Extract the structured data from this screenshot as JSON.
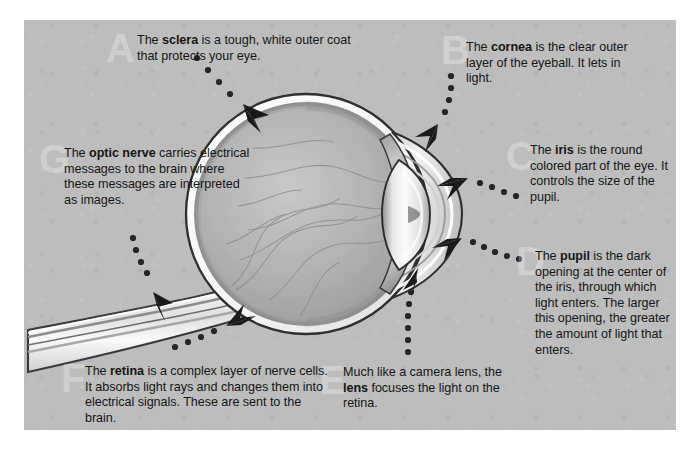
{
  "diagram": {
    "panel_background": "#bdbdbd",
    "page_background": "#ffffff",
    "text_color": "#161616",
    "watermark_color": "#d6d6d6"
  },
  "callouts": [
    {
      "id": "sclera",
      "letter": "A",
      "term": "sclera",
      "text_before": "The ",
      "text_after": " is a tough, white outer coat that protects your eye.",
      "full_text": "The sclera is a tough, white outer coat that protects your eye."
    },
    {
      "id": "cornea",
      "letter": "B",
      "term": "cornea",
      "text_before": "The ",
      "text_after": " is the clear outer layer of the eyeball. It lets in light.",
      "full_text": "The cornea is the clear outer layer of the eyeball. It lets in light."
    },
    {
      "id": "iris",
      "letter": "C",
      "term": "iris",
      "text_before": "The ",
      "text_after": " is the round colored part of the eye. It controls the size of the pupil.",
      "full_text": "The iris is the round colored part of the eye. It controls the size of the pupil."
    },
    {
      "id": "pupil",
      "letter": "D",
      "term": "pupil",
      "text_before": "The ",
      "text_after": " is the dark opening at the center of the iris, through which light enters. The larger this opening, the greater the amount of light that enters.",
      "full_text": "The pupil is the dark opening at the center of the iris, through which light enters. The larger this opening, the greater the amount of light that enters."
    },
    {
      "id": "lens",
      "letter": "E",
      "term": "lens",
      "text_before": "Much like a camera lens, the ",
      "text_after": " focuses the light on the retina.",
      "full_text": "Much like a camera lens, the lens focuses the light on the retina."
    },
    {
      "id": "retina",
      "letter": "F",
      "term": "retina",
      "text_before": "The ",
      "text_after": " is a complex layer of nerve cells. It absorbs light rays and changes them into electrical signals. These are sent to the brain.",
      "full_text": "The retina is a complex layer of nerve cells. It absorbs light rays and changes them into electrical signals. These are sent to the brain."
    },
    {
      "id": "optic-nerve",
      "letter": "G",
      "term": "optic nerve",
      "text_before": "The ",
      "text_after": " carries electrical messages to the brain where these messages are interpreted as images.",
      "full_text": "The optic nerve carries electrical messages to the brain where these messages are interpreted as images."
    }
  ]
}
